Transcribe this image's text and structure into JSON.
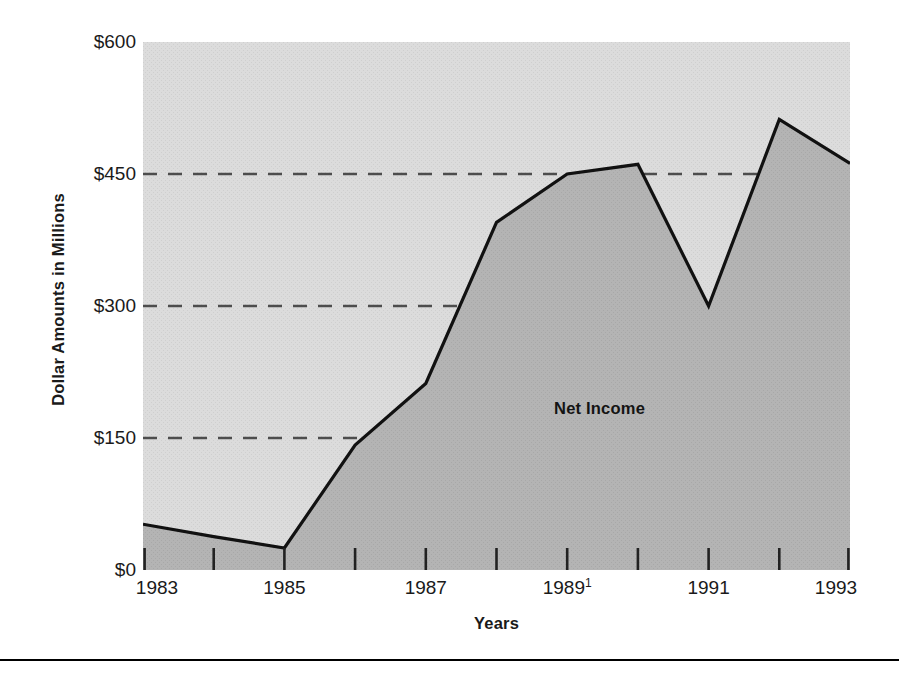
{
  "chart_data": {
    "type": "area",
    "title": "",
    "subtitle": "",
    "xlabel": "Years",
    "ylabel": "Dollar Amounts in Millions",
    "series_label": "Net Income",
    "grid": true,
    "legend_position": "inline-annotation",
    "x": [
      1983,
      1984,
      1985,
      1986,
      1987,
      1988,
      1989,
      1990,
      1991,
      1992,
      1993
    ],
    "categories": [
      "1983",
      "1984",
      "1985",
      "1986",
      "1987",
      "1988",
      "1989",
      "1990",
      "1991",
      "1992",
      "1993"
    ],
    "series": [
      {
        "name": "Net Income",
        "values": [
          52,
          38,
          25,
          142,
          212,
          395,
          450,
          461,
          300,
          512,
          462
        ]
      }
    ],
    "xlim": [
      1983,
      1993
    ],
    "ylim": [
      0,
      600
    ],
    "ytick_values": [
      0,
      150,
      300,
      450,
      600
    ],
    "ytick_labels": [
      "$0",
      "$150",
      "$300",
      "$450",
      "$600"
    ],
    "xtick_values": [
      1983,
      1985,
      1987,
      1989,
      1991,
      1993
    ],
    "xtick_labels": [
      "1983",
      "1985",
      "1987",
      "1989",
      "1991",
      "1993"
    ],
    "xtick_footnote_marks": [
      "",
      "",
      "",
      "1",
      "",
      ""
    ],
    "gridline_values": [
      150,
      300,
      450
    ],
    "colors": {
      "plot_background": "#d9d9d9",
      "area_fill": "#b3b3b3",
      "line": "#111111",
      "gridline": "#4d4d4d",
      "text": "#1a1a1a",
      "rule": "#000000"
    }
  },
  "axes": {
    "y_title": "Dollar Amounts in Millions",
    "x_title": "Years",
    "y_labels": [
      {
        "text": "$600",
        "value": 600
      },
      {
        "text": "$450",
        "value": 450
      },
      {
        "text": "$300",
        "value": 300
      },
      {
        "text": "$150",
        "value": 150
      },
      {
        "text": "$0",
        "value": 0
      }
    ],
    "x_labels": [
      {
        "text": "1983",
        "sup": "",
        "value": 1983
      },
      {
        "text": "1985",
        "sup": "",
        "value": 1985
      },
      {
        "text": "1987",
        "sup": "",
        "value": 1987
      },
      {
        "text": "1989",
        "sup": "1",
        "value": 1989
      },
      {
        "text": "1991",
        "sup": "",
        "value": 1991
      },
      {
        "text": "1993",
        "sup": "",
        "value": 1993
      }
    ]
  },
  "annotation": {
    "series_label": "Net Income"
  }
}
